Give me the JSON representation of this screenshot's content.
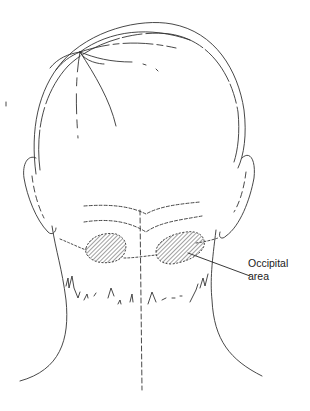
{
  "figure": {
    "annotations": [
      {
        "id": "occipital",
        "lines": [
          "Occipital",
          "area"
        ]
      }
    ],
    "highlighted_regions": [
      "left occipital area",
      "right occipital area"
    ],
    "colors": {
      "line": "#333333",
      "hatch": "#444444",
      "background": "#ffffff"
    }
  }
}
